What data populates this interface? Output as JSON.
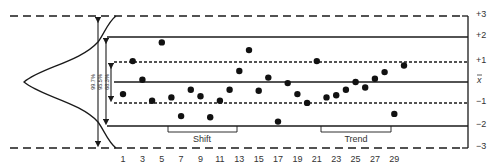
{
  "chart_data": {
    "type": "scatter",
    "title": "",
    "subtitle": "Control chart with normal distribution overlay",
    "xlabel": "",
    "ylabel": "",
    "x_tick_labels": [
      "1",
      "3",
      "5",
      "7",
      "9",
      "11",
      "13",
      "15",
      "17",
      "19",
      "21",
      "23",
      "25",
      "27",
      "29"
    ],
    "y_tick_labels": [
      "+3",
      "+2",
      "+1",
      "x̄",
      "−1",
      "−2",
      "−3"
    ],
    "ylim": [
      -3,
      3
    ],
    "grid": false,
    "series": [
      {
        "name": "samples",
        "x": [
          1,
          2,
          3,
          4,
          5,
          6,
          7,
          8,
          9,
          10,
          11,
          12,
          13,
          14,
          15,
          16,
          17,
          18,
          19,
          20,
          21,
          22,
          23,
          24,
          25,
          26,
          27,
          28,
          29,
          30
        ],
        "values": [
          -0.55,
          0.95,
          0.1,
          -0.85,
          1.8,
          -0.7,
          -1.55,
          -0.35,
          -0.65,
          -1.6,
          -0.85,
          -0.35,
          0.5,
          1.45,
          -0.4,
          0.2,
          -1.8,
          -0.05,
          -0.55,
          -0.95,
          0.95,
          -0.7,
          -0.6,
          -0.35,
          0.0,
          -0.25,
          0.15,
          0.45,
          -1.45,
          0.75
        ]
      }
    ],
    "control_lines": [
      {
        "label": "+3",
        "value": 3,
        "style": "dashed"
      },
      {
        "label": "+2",
        "value": 2,
        "style": "solid"
      },
      {
        "label": "+1",
        "value": 1,
        "style": "dotted"
      },
      {
        "label": "x̄",
        "value": 0,
        "style": "solid"
      },
      {
        "label": "−1",
        "value": -1,
        "style": "dotted"
      },
      {
        "label": "−2",
        "value": -2,
        "style": "solid"
      },
      {
        "label": "−3",
        "value": -3,
        "style": "dashed"
      }
    ],
    "coverage_annotations": [
      {
        "label": "99.7%",
        "range": [
          -3,
          3
        ]
      },
      {
        "label": "95.5%",
        "range": [
          -2,
          2
        ]
      },
      {
        "label": "68.3%",
        "range": [
          -1,
          1
        ]
      }
    ],
    "pattern_annotations": [
      {
        "label": "Shift",
        "x_range": [
          7,
          14
        ]
      },
      {
        "label": "Trend",
        "x_range": [
          21,
          28
        ]
      }
    ],
    "legend": "none"
  },
  "labels": {
    "plus3": "+3",
    "plus2": "+2",
    "plus1": "+1",
    "mean": "x",
    "minus1": "−1",
    "minus2": "−2",
    "minus3": "−3",
    "pct997": "99.7%",
    "pct955": "95.5%",
    "pct683": "68.3%",
    "shift": "Shift",
    "trend": "Trend"
  },
  "colors": {
    "line": "#1a1a1a",
    "text": "#333333",
    "point": "#111111"
  }
}
